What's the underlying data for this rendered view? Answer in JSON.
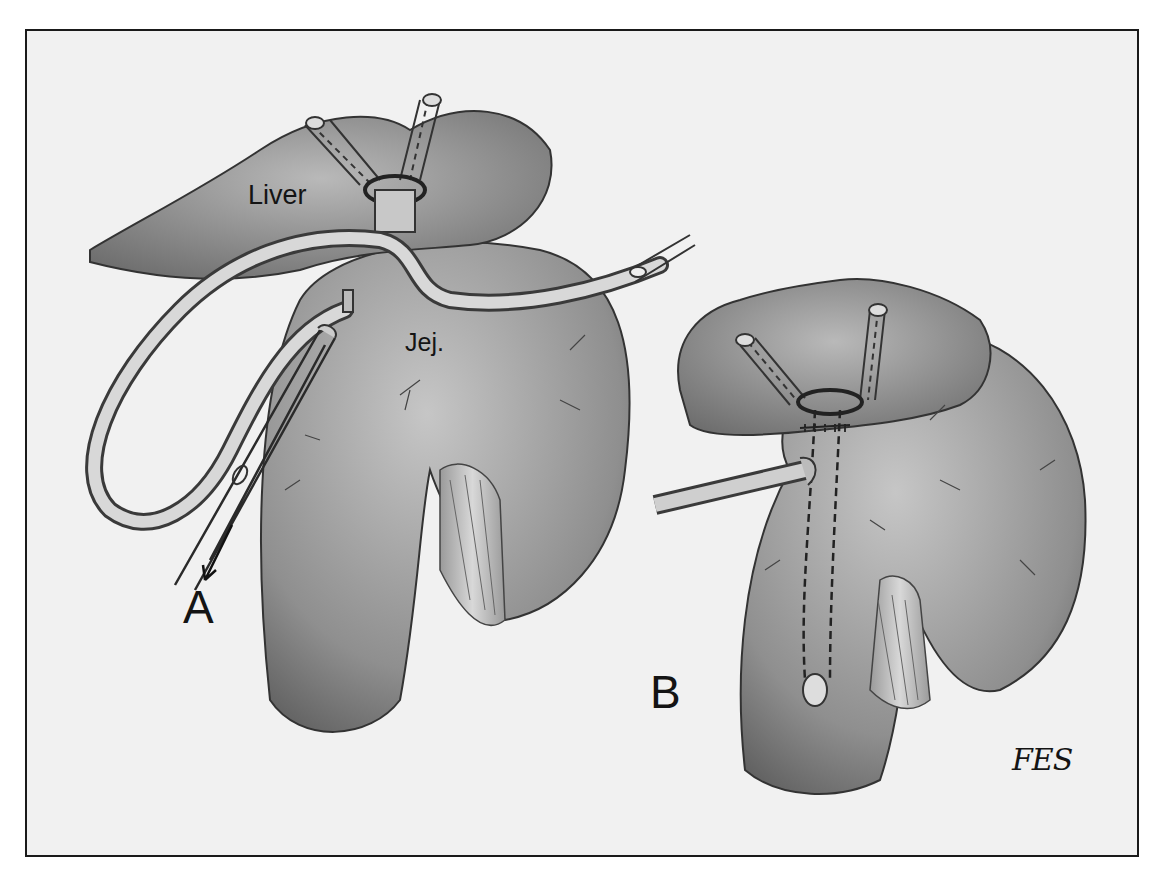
{
  "figure": {
    "panels": [
      {
        "id": "A",
        "label": "A",
        "description": "Liver with transhepatic silicone stent looped externally; jejunal limb with clamp and withdrawal arrow"
      },
      {
        "id": "B",
        "label": "B",
        "description": "Completed hepaticojejunostomy with stent exiting through jejunal wall"
      }
    ],
    "annotations": {
      "liver": "Liver",
      "jejunum": "Jej.",
      "panel_a": "A",
      "panel_b": "B",
      "signature": "FES"
    },
    "colors": {
      "background": "#f1f1f1",
      "border": "#1a1a1a",
      "tissue_light": "#b8b8b8",
      "tissue_mid": "#8c8c8c",
      "tissue_dark": "#5a5a5a",
      "tube": "#d0d0d0",
      "ink": "#141414"
    }
  }
}
